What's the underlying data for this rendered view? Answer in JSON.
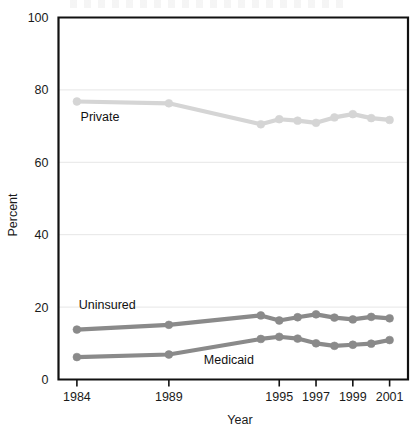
{
  "chart_data": {
    "type": "line",
    "title": "",
    "xlabel": "Year",
    "ylabel": "Percent",
    "ylim": [
      0,
      100
    ],
    "xlim": [
      1983,
      2002
    ],
    "yticks": [
      0,
      20,
      40,
      60,
      80,
      100
    ],
    "ytick_labels": [
      "0",
      "20",
      "40",
      "60",
      "80",
      "100"
    ],
    "xticks": [
      1984,
      1989,
      1995,
      1997,
      1999,
      2001
    ],
    "xtick_labels": [
      "1984",
      "1989",
      "1995",
      "1997",
      "1999",
      "2001"
    ],
    "grid": "horizontal",
    "legend": "inline-labels",
    "x": [
      1984,
      1989,
      1994,
      1995,
      1996,
      1997,
      1998,
      1999,
      2000,
      2001
    ],
    "series": [
      {
        "name": "Private",
        "color": "#d5d5d5",
        "values": [
          76.8,
          76.3,
          70.5,
          71.9,
          71.5,
          70.9,
          72.4,
          73.3,
          72.2,
          71.7
        ]
      },
      {
        "name": "Uninsured",
        "color": "#8a8a8a",
        "values": [
          13.8,
          15.1,
          17.7,
          16.3,
          17.2,
          18.0,
          17.1,
          16.6,
          17.3,
          16.9
        ]
      },
      {
        "name": "Medicaid",
        "color": "#8a8a8a",
        "values": [
          6.2,
          6.9,
          11.2,
          11.8,
          11.3,
          10.0,
          9.3,
          9.6,
          9.9,
          10.9
        ]
      }
    ],
    "annotations": [
      {
        "name": "private-label",
        "text": "Private",
        "x": 1984.2,
        "y": 71.5
      },
      {
        "name": "uninsured-label",
        "text": "Uninsured",
        "x": 1984.1,
        "y": 19.6
      },
      {
        "name": "medicaid-label",
        "text": "Medicaid",
        "x": 1990.9,
        "y": 4.4
      }
    ]
  }
}
